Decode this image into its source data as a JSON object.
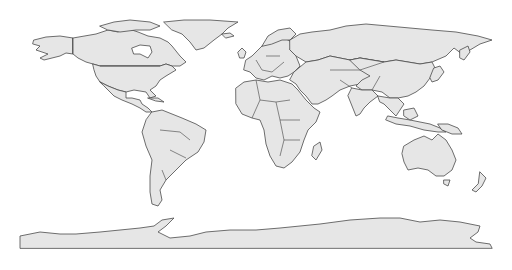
{
  "map": {
    "projection": "equirectangular",
    "colors": {
      "background": "#ffffff",
      "land_fill": "#e6e6e6",
      "border": "#4a4a4a"
    },
    "stroke_width": 0.8,
    "regions": [
      {
        "name": "alaska",
        "points": "34,40 46,37 60,36 73,38 73,54 66,53 60,56 52,58 44,60 40,58 48,54 42,52 36,50 40,46 33,44"
      },
      {
        "name": "canada",
        "points": "73,38 96,34 108,30 118,32 126,28 138,32 148,36 160,38 168,42 172,46 180,56 186,62 180,66 172,66 166,64 160,66 100,66 93,64 86,62 78,58 73,54"
      },
      {
        "name": "hudson-bay",
        "points": "132,48 140,45 150,46 152,52 148,58 140,54 134,54",
        "fill": "#ffffff"
      },
      {
        "name": "arctic-islands",
        "points": "100,26 114,22 130,20 150,22 160,26 150,30 136,30 120,32 108,30"
      },
      {
        "name": "greenland",
        "points": "164,22 184,20 210,20 238,22 228,28 222,34 214,40 204,48 196,50 190,42 182,34 172,30"
      },
      {
        "name": "usa",
        "points": "93,64 100,66 160,66 166,64 172,66 176,70 166,76 160,80 156,86 150,90 156,96 150,98 146,92 134,90 126,92 118,90 108,86 100,82 96,76 94,70"
      },
      {
        "name": "mexico-central-america",
        "points": "100,82 108,86 118,90 126,92 126,98 132,98 140,100 142,104 148,108 152,112 146,112 140,108 132,104 122,100 114,96 108,90 104,86"
      },
      {
        "name": "cuba",
        "points": "148,98 158,98 164,102 156,101"
      },
      {
        "name": "south-america",
        "points": "152,112 162,110 172,114 182,118 196,124 206,130 204,142 198,152 186,160 176,170 166,180 160,190 162,200 158,206 152,204 150,192 150,176 152,160 146,146 142,132 146,120"
      },
      {
        "name": "iceland",
        "points": "222,34 230,33 234,36 226,38"
      },
      {
        "name": "uk",
        "points": "238,52 242,48 246,52 244,58 240,58"
      },
      {
        "name": "europe",
        "points": "246,60 252,56 258,50 264,44 272,40 284,38 292,42 290,50 296,56 300,66 294,72 288,76 280,78 272,76 264,80 256,78 250,72 244,70"
      },
      {
        "name": "scandinavia",
        "points": "262,46 268,36 278,30 290,28 296,34 290,40 282,40 272,44"
      },
      {
        "name": "russia",
        "points": "290,40 300,34 312,32 330,30 346,26 366,24 388,26 410,28 432,30 456,32 478,36 492,40 480,44 470,50 462,54 454,48 446,56 432,62 420,64 408,62 396,60 384,62 372,60 360,58 350,60 340,58 330,56 318,60 306,62 296,56 290,50"
      },
      {
        "name": "kamchatka",
        "points": "460,50 468,46 470,52 464,60 460,58"
      },
      {
        "name": "middle-east-central-asia",
        "points": "294,72 306,62 318,60 330,56 340,58 350,60 360,58 372,60 384,62 390,70 380,76 370,80 360,84 350,86 340,90 332,96 326,100 318,104 312,104 306,96 300,90 296,84 290,80"
      },
      {
        "name": "china-east-asia",
        "points": "350,60 360,58 372,60 384,62 396,60 408,62 420,64 432,62 436,70 430,78 424,86 416,92 408,96 398,98 390,98 382,92 372,90 362,90 356,86 362,80 370,76 360,70"
      },
      {
        "name": "japan",
        "points": "434,68 440,66 444,72 438,80 432,82 430,78"
      },
      {
        "name": "india",
        "points": "352,88 362,90 372,90 378,96 370,102 364,108 360,114 356,116 352,106 348,96"
      },
      {
        "name": "southeast-asia",
        "points": "378,96 390,98 398,98 404,104 400,110 396,116 390,110 384,104 380,102"
      },
      {
        "name": "africa",
        "points": "236,88 244,82 256,80 268,82 280,80 292,84 298,90 306,100 314,108 320,112 316,122 308,130 304,140 300,152 292,162 284,168 276,166 270,156 266,144 264,130 260,120 252,118 242,114 236,104"
      },
      {
        "name": "madagascar",
        "points": "314,146 320,142 322,150 316,160 312,156"
      },
      {
        "name": "indonesia",
        "points": "388,116 398,118 410,120 420,122 430,124 440,128 446,132 438,132 424,130 410,126 396,124 386,120"
      },
      {
        "name": "borneo",
        "points": "404,110 414,108 418,116 410,120 404,116"
      },
      {
        "name": "new-guinea",
        "points": "438,124 448,124 458,128 462,134 452,134 442,130"
      },
      {
        "name": "australia",
        "points": "404,146 414,140 424,136 432,140 438,134 446,140 452,150 456,160 452,170 444,176 436,176 428,170 418,168 408,170 404,162 402,154"
      },
      {
        "name": "tasmania",
        "points": "444,180 450,180 448,186 444,184"
      },
      {
        "name": "new-zealand",
        "points": "480,172 486,178 482,186 476,192 472,190 478,184"
      },
      {
        "name": "antarctica",
        "points": "20,248 20,236 40,232 60,234 76,234 100,232 120,230 140,228 154,226 162,220 174,218 166,226 158,232 170,238 190,236 206,232 230,230 256,230 280,228 300,226 320,224 350,220 380,218 400,218 420,222 440,220 460,222 480,226 478,232 470,238 476,242 490,244 492,248"
      }
    ],
    "borders": [
      {
        "name": "us-canada-border",
        "d": "M100,66 L160,66"
      },
      {
        "name": "alaska-canada-border",
        "d": "M73,38 L73,54"
      },
      {
        "name": "africa-borders",
        "d": "M256,80 L260,100 L276,102 L290,100 M260,100 L252,118 M276,102 L280,120 L300,120 M280,120 L284,140 L300,140 M284,140 L280,156"
      },
      {
        "name": "south-america-borders",
        "d": "M160,130 L180,132 L190,140 M170,150 L186,158 M166,180 L162,170"
      },
      {
        "name": "europe-borders",
        "d": "M256,60 L262,70 L272,72 L284,62 M266,56 L280,56"
      },
      {
        "name": "asia-borders",
        "d": "M330,70 L360,70 L384,62 M340,80 L352,88 M372,90 L380,76"
      }
    ]
  }
}
